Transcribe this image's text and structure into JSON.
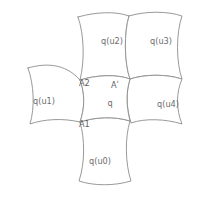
{
  "diagram": {
    "stroke_color": "#8d8d8d",
    "label_color": "#6d6d6d",
    "background_color": "#ffffff",
    "cells": [
      {
        "id": "center",
        "label": "q",
        "label_x": 110,
        "label_y": 103,
        "path": "M 80,80 C 96,75 117,74 130,79 C 126,92 126,105 130,121 C 114,116 95,117 80,122 C 85,108 85,93 80,80 Z"
      },
      {
        "id": "u2",
        "label": "q(u2)",
        "label_x": 112,
        "label_y": 41,
        "path": "M 78,17 C 95,12 116,11 129,16 C 124,32 124,62 130,79 C 116,74 96,75 80,80 C 85,60 84,34 78,17 Z"
      },
      {
        "id": "u3",
        "label": "q(u3)",
        "label_x": 161,
        "label_y": 41,
        "path": "M 129,16 C 145,11 168,11 182,16 C 176,33 176,62 182,79 C 166,74 145,74 130,79 C 124,62 124,32 129,16 Z"
      },
      {
        "id": "u1",
        "label": "q(u1)",
        "label_x": 44,
        "label_y": 101,
        "path": "M 28,68 C 45,63 65,63 80,80 C 85,93 85,108 80,122 C 63,118 44,119 30,124 C 35,107 34,85 28,68 Z"
      },
      {
        "id": "u4",
        "label": "q(u4)",
        "label_x": 168,
        "label_y": 104,
        "path": "M 130,79 C 146,74 166,74 182,79 C 176,93 176,109 182,124 C 166,119 145,118 131,123 C 126,107 126,92 130,79 Z"
      },
      {
        "id": "u0",
        "label": "q(u0)",
        "label_x": 100,
        "label_y": 161,
        "path": "M 80,122 C 95,117 114,116 130,121 C 125,137 125,163 131,181 C 114,186 94,186 79,181 C 85,163 85,139 80,122 Z"
      }
    ],
    "vertices": [
      {
        "id": "A2",
        "label": "A2",
        "label_x": 79,
        "label_y": 83,
        "point_x": 80,
        "point_y": 80
      },
      {
        "id": "Aprime",
        "label": "Aʹ",
        "label_x": 111,
        "label_y": 85,
        "point_x": 130,
        "point_y": 79
      },
      {
        "id": "A1",
        "label": "A1",
        "label_x": 79,
        "label_y": 124,
        "point_x": 80,
        "point_y": 122
      }
    ]
  }
}
